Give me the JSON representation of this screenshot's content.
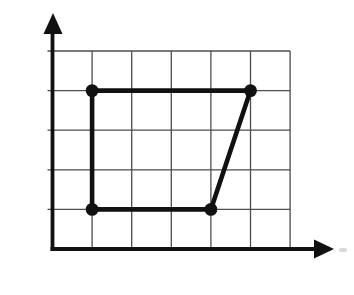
{
  "chart_data": {
    "type": "scatter",
    "points": [
      {
        "label": "A",
        "x": 1,
        "y": 4
      },
      {
        "label": "B",
        "x": 5,
        "y": 4
      },
      {
        "label": "C",
        "x": 4,
        "y": 1
      },
      {
        "label": "D",
        "x": 1,
        "y": 1
      }
    ],
    "polygon_order": [
      "A",
      "B",
      "C",
      "D"
    ],
    "x_ticks": [
      0,
      1,
      2,
      3,
      4,
      5,
      6
    ],
    "y_ticks": [
      1,
      2,
      3,
      4,
      5
    ],
    "xlim": [
      0,
      6
    ],
    "ylim": [
      0,
      5
    ],
    "grid": true,
    "legend": false,
    "xlabel": "",
    "ylabel": "",
    "colors": {
      "shape_line": "#111111",
      "axis_line": "#111111",
      "grid_line": "#4d4d4d",
      "text": "#111111",
      "background": "#ffffff",
      "artifact": "#c7c7c7"
    },
    "label_offsets": {
      "A": [
        -17,
        -17
      ],
      "B": [
        22,
        -18
      ],
      "C": [
        22,
        21
      ],
      "D": [
        -18,
        18
      ]
    }
  }
}
